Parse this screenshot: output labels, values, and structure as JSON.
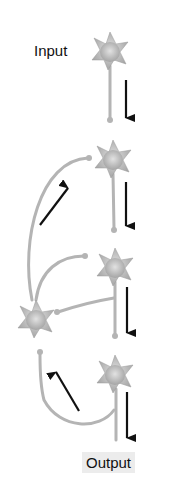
{
  "labels": {
    "input": "Input",
    "output": "Output"
  },
  "diagram": {
    "nodes": [
      {
        "id": "n1",
        "role": "input neuron",
        "x": 110,
        "y": 52
      },
      {
        "id": "n2",
        "role": "relay neuron",
        "x": 113,
        "y": 160
      },
      {
        "id": "n3",
        "role": "relay neuron",
        "x": 115,
        "y": 268
      },
      {
        "id": "n4",
        "role": "output neuron",
        "x": 115,
        "y": 375
      },
      {
        "id": "i1",
        "role": "feedback interneuron",
        "x": 36,
        "y": 320
      }
    ],
    "arrows": [
      {
        "from": "n1",
        "to": "n2",
        "direction": "down"
      },
      {
        "from": "n2",
        "to": "n3",
        "direction": "down"
      },
      {
        "from": "n3",
        "to": "n4",
        "direction": "down"
      },
      {
        "from": "n4",
        "to": "output",
        "direction": "down"
      },
      {
        "from": "i1",
        "to": "n2",
        "direction": "up-right"
      },
      {
        "from": "n4",
        "to": "i1",
        "direction": "up-left"
      }
    ],
    "colors": {
      "neuron": "#b0b0b0",
      "neuron_core": "#d8d8d8",
      "arrow": "#111111",
      "output_bg": "#ececec"
    }
  }
}
